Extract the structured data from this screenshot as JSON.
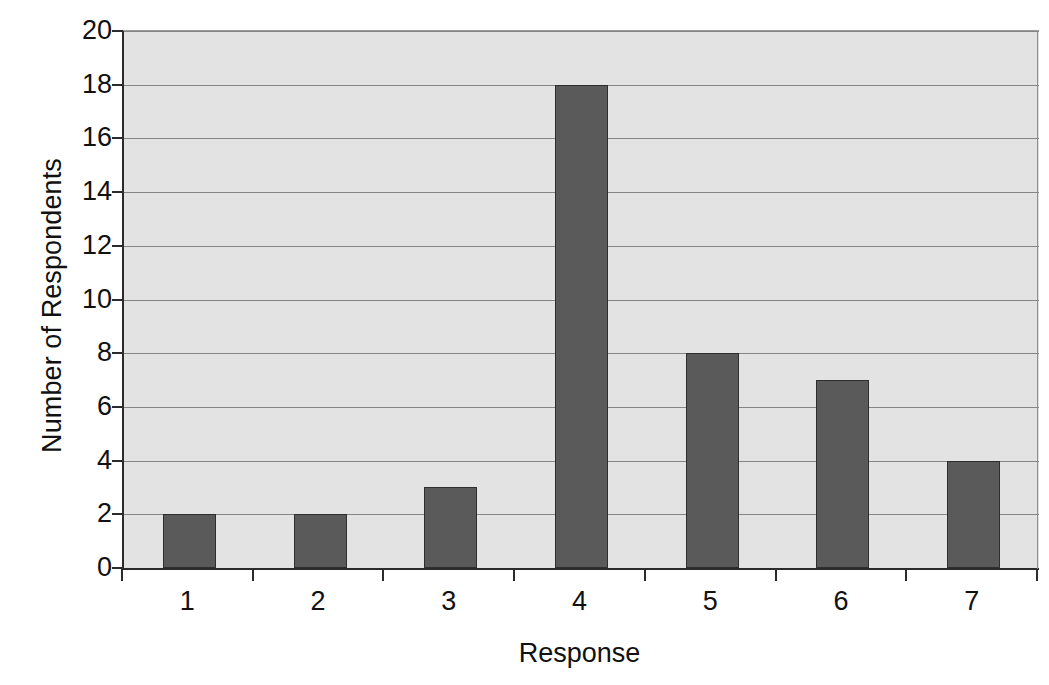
{
  "chart_data": {
    "type": "bar",
    "title": "",
    "subtitle": "",
    "xlabel": "Response",
    "ylabel": "Number of Respondents",
    "categories": [
      "1",
      "2",
      "3",
      "4",
      "5",
      "6",
      "7"
    ],
    "values": [
      2,
      2,
      3,
      18,
      8,
      7,
      4
    ],
    "series": [
      {
        "name": "Number of Respondents",
        "values": [
          2,
          2,
          3,
          18,
          8,
          7,
          4
        ]
      }
    ],
    "ylim": [
      0,
      20
    ],
    "ytick_step": 2,
    "ytick_labels": [
      "0",
      "2",
      "4",
      "6",
      "8",
      "10",
      "12",
      "14",
      "16",
      "18",
      "20"
    ],
    "xtick_labels": [
      "1",
      "2",
      "3",
      "4",
      "5",
      "6",
      "7"
    ],
    "grid": true,
    "grid_axis": "y",
    "legend": false,
    "legend_position": "none",
    "annotations": [],
    "colors": {
      "bar_fill": "#5a5a5a",
      "bar_border": "#2e2e2e",
      "plot_background": "#e3e3e3",
      "figure_background": "#ffffff",
      "gridline": "#858585",
      "axis_line": "#2b2b2b",
      "text": "#111111"
    }
  }
}
